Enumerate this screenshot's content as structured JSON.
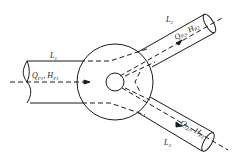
{
  "diagram": {
    "colors": {
      "stroke": "#1a1a1a",
      "background": "#ffffff"
    },
    "inlet": {
      "pipe_label": {
        "main": "L",
        "sub": "1"
      },
      "flow_label": {
        "Q": "Q",
        "Q_sub": "P1",
        "sep": ",",
        "H": "H",
        "H_sub": "P1"
      }
    },
    "outlet_upper": {
      "pipe_label": {
        "main": "L",
        "sub": "2"
      },
      "flow_label": {
        "Q": "Q",
        "Q_sub": "P2",
        "sep": ",",
        "H": "H",
        "H_sub": "P2"
      }
    },
    "outlet_lower": {
      "pipe_label": {
        "main": "L",
        "sub": "3"
      },
      "flow_label": {
        "Q": "Q",
        "Q_sub": "Q2",
        "sep": ",",
        "H": "H",
        "H_sub": "P3"
      }
    }
  }
}
